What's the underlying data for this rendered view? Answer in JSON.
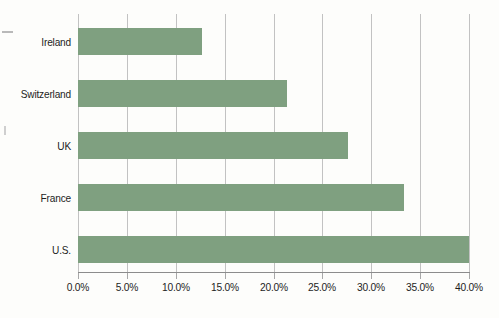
{
  "chart_data": {
    "type": "bar",
    "orientation": "horizontal",
    "title": "",
    "subtitle": "",
    "xlabel": "",
    "ylabel": "",
    "categories": [
      "Ireland",
      "Switzerland",
      "UK",
      "France",
      "U.S."
    ],
    "values": [
      12.7,
      21.4,
      27.6,
      33.3,
      40.0
    ],
    "value_format": "percent",
    "xlim": [
      0.0,
      40.0
    ],
    "xticks": [
      0.0,
      5.0,
      10.0,
      15.0,
      20.0,
      25.0,
      30.0,
      35.0,
      40.0
    ],
    "xtick_labels": [
      "0.0%",
      "5.0%",
      "10.0%",
      "15.0%",
      "20.0%",
      "25.0%",
      "30.0%",
      "35.0%",
      "40.0%"
    ],
    "grid": "vertical",
    "legend": "none",
    "series": [
      {
        "name": "",
        "values": [
          12.7,
          21.4,
          27.6,
          33.3,
          40.0
        ]
      }
    ],
    "colors": {
      "bar_fill": "#7fa080",
      "gridline": "#c2c2c2",
      "axis_line": "#8c8c8c",
      "text": "#1d1d1d",
      "background": "#fdfdfb"
    }
  }
}
